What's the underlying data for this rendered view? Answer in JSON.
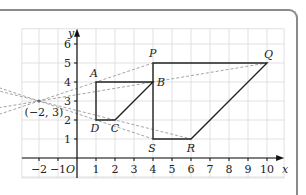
{
  "chart_data": {
    "type": "scatter",
    "title": "",
    "xlabel": "x",
    "ylabel": "y",
    "origin_label": "O",
    "xlim": [
      -2.9,
      10.9
    ],
    "ylim": [
      -1.05,
      6.8
    ],
    "grid": true,
    "x_ticks": [
      -2,
      -1,
      1,
      2,
      3,
      4,
      5,
      6,
      7,
      8,
      9,
      10
    ],
    "x_tick_labels": [
      "−2",
      "−1",
      "1",
      "2",
      "3",
      "4",
      "5",
      "6",
      "7",
      "8",
      "9",
      "10"
    ],
    "y_ticks": [
      1,
      2,
      3,
      4,
      5,
      6
    ],
    "y_tick_labels": [
      "1",
      "2",
      "3",
      "4",
      "5",
      "6"
    ],
    "centre": {
      "x": -2,
      "y": 3,
      "label": "(−2, 3)"
    },
    "object_shape": {
      "name": "ABCD",
      "vertices": [
        {
          "label": "A",
          "x": 1,
          "y": 4
        },
        {
          "label": "B",
          "x": 4,
          "y": 4
        },
        {
          "label": "C",
          "x": 2,
          "y": 2
        },
        {
          "label": "D",
          "x": 1,
          "y": 2
        }
      ]
    },
    "image_shape": {
      "name": "PQRS",
      "vertices": [
        {
          "label": "P",
          "x": 4,
          "y": 5
        },
        {
          "label": "Q",
          "x": 10,
          "y": 5
        },
        {
          "label": "R",
          "x": 6,
          "y": 1
        },
        {
          "label": "S",
          "x": 4,
          "y": 1
        }
      ]
    },
    "scale_factor": 2,
    "colors": {
      "shape": "#222222",
      "ray": "#9a9a9a",
      "grid": "#d9d9d9",
      "axis": "#111111"
    }
  }
}
